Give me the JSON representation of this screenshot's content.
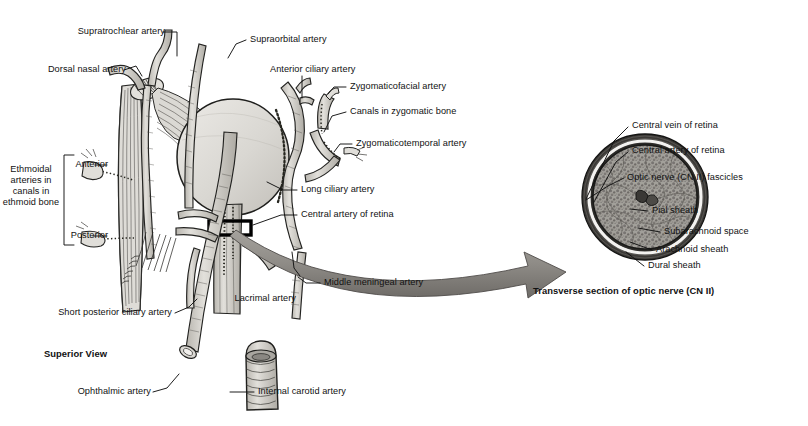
{
  "figure": {
    "view_caption": "Superior View",
    "inset_caption": "Transverse section of optic nerve (CN II)",
    "bracket_label": "Ethmoidal arteries in canals in ethmoid bone",
    "colors": {
      "ink": "#111111",
      "globe_fill": "#d6d4cf",
      "vessel_fill": "#c9c6c0",
      "arrow_fill": "#8e8b86",
      "nerve_core": "#9b9892",
      "dural_sheath": "#4a4845",
      "background": "#ffffff"
    }
  },
  "orbit_labels": [
    {
      "id": "supratrochlear",
      "text": "Supratrochlear artery"
    },
    {
      "id": "dorsal-nasal",
      "text": "Dorsal nasal artery"
    },
    {
      "id": "supraorbital",
      "text": "Supraorbital artery"
    },
    {
      "id": "anterior-ciliary",
      "text": "Anterior ciliary artery"
    },
    {
      "id": "zygomaticofacial",
      "text": "Zygomaticofacial artery"
    },
    {
      "id": "canals-zygomatic",
      "text": "Canals in zygomatic bone"
    },
    {
      "id": "zygomaticotemporal",
      "text": "Zygomaticotemporal artery"
    },
    {
      "id": "long-ciliary",
      "text": "Long ciliary artery"
    },
    {
      "id": "central-artery-retina",
      "text": "Central artery of retina"
    },
    {
      "id": "middle-meningeal",
      "text": "Middle meningeal artery"
    },
    {
      "id": "lacrimal",
      "text": "Lacrimal artery"
    },
    {
      "id": "short-posterior-ciliary",
      "text": "Short posterior ciliary artery"
    },
    {
      "id": "ophthalmic",
      "text": "Ophthalmic artery"
    },
    {
      "id": "internal-carotid",
      "text": "Internal carotid artery"
    },
    {
      "id": "ethmoidal-anterior",
      "text": "Anterior"
    },
    {
      "id": "ethmoidal-posterior",
      "text": "Posterior"
    }
  ],
  "nerve_labels": [
    {
      "id": "central-vein-retina",
      "text": "Central vein of retina"
    },
    {
      "id": "central-artery-retina-2",
      "text": "Central artery of retina"
    },
    {
      "id": "optic-nerve-fascicles",
      "text": "Optic nerve (CN II) fascicles"
    },
    {
      "id": "pial-sheath",
      "text": "Pial sheath"
    },
    {
      "id": "subarachnoid-space",
      "text": "Subarachnoid space"
    },
    {
      "id": "arachnoid-sheath",
      "text": "Arachnoid sheath"
    },
    {
      "id": "dural-sheath",
      "text": "Dural sheath"
    }
  ]
}
